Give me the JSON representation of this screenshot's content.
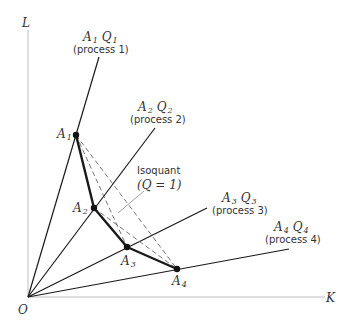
{
  "diagram": {
    "type": "isoquant-activity-analysis",
    "axes": {
      "y_label": "L",
      "x_label": "K",
      "origin_label": "O"
    },
    "processes": [
      {
        "ray_label": "A",
        "ray_sub": "1",
        "q_label": "Q",
        "q_sub": "1",
        "process_label": "(process 1)",
        "point_label": "A",
        "point_sub": "1"
      },
      {
        "ray_label": "A",
        "ray_sub": "2",
        "q_label": "Q",
        "q_sub": "2",
        "process_label": "(process 2)",
        "point_label": "A",
        "point_sub": "2"
      },
      {
        "ray_label": "A",
        "ray_sub": "3",
        "q_label": "Q",
        "q_sub": "3",
        "process_label": "(process 3)",
        "point_label": "A",
        "point_sub": "3"
      },
      {
        "ray_label": "A",
        "ray_sub": "4",
        "q_label": "Q",
        "q_sub": "4",
        "process_label": "(process 4)",
        "point_label": "A",
        "point_sub": "4"
      }
    ],
    "isoquant": {
      "label": "Isoquant",
      "equation": "(Q = 1)"
    },
    "colors": {
      "line": "#1a1a1a",
      "axis": "#bdbdbd",
      "text": "#333333",
      "dashed": "#555555"
    }
  }
}
